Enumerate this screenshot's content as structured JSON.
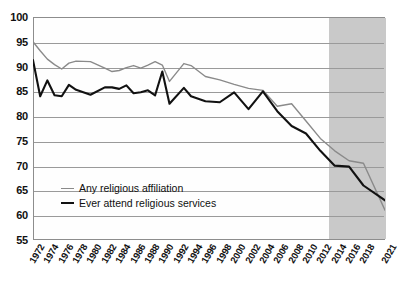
{
  "chart_data": {
    "type": "line",
    "title": "",
    "subtitle": "",
    "xlabel": "",
    "ylabel": "",
    "ylim": [
      55,
      100
    ],
    "ytick_step": 5,
    "yticks": [
      100,
      95,
      90,
      85,
      80,
      75,
      70,
      65,
      60,
      55
    ],
    "grid": true,
    "legend_position": "inside-lower-left",
    "xtick_labels": [
      "1972",
      "1974",
      "1976",
      "1978",
      "1980",
      "1982",
      "1984",
      "1986",
      "1988",
      "1990",
      "1992",
      "1994",
      "1996",
      "1998",
      "2000",
      "2002",
      "2004",
      "2006",
      "2008",
      "2010",
      "2012",
      "2014",
      "2016",
      "2018",
      "2021"
    ],
    "x": [
      1972,
      1973,
      1974,
      1975,
      1976,
      1977,
      1978,
      1980,
      1982,
      1983,
      1984,
      1985,
      1986,
      1987,
      1988,
      1989,
      1990,
      1991,
      1993,
      1994,
      1996,
      1998,
      2000,
      2002,
      2004,
      2006,
      2008,
      2010,
      2012,
      2014,
      2016,
      2018,
      2021
    ],
    "annotations": [
      {
        "type": "shaded-band",
        "label": "",
        "x_start": 2013,
        "x_end": 2021,
        "color": "#c9c9c9"
      }
    ],
    "series": [
      {
        "name": "Any religious affiliation",
        "color": "#8a8a8a",
        "values": [
          95.0,
          93.2,
          91.5,
          90.4,
          89.5,
          90.7,
          91.1,
          91.0,
          89.7,
          89.0,
          89.2,
          89.8,
          90.2,
          89.7,
          90.3,
          91.0,
          90.3,
          87.0,
          90.6,
          90.2,
          88.0,
          87.3,
          86.4,
          85.6,
          85.2,
          82.0,
          82.5,
          79.0,
          75.5,
          73.0,
          71.0,
          70.5,
          61.0
        ]
      },
      {
        "name": "Ever attend religious services",
        "color": "#111111",
        "values": [
          91.3,
          84.0,
          87.2,
          84.2,
          84.0,
          86.3,
          85.3,
          84.3,
          85.8,
          85.8,
          85.5,
          86.2,
          84.6,
          84.8,
          85.2,
          84.2,
          89.0,
          82.5,
          85.7,
          84.0,
          83.0,
          82.8,
          84.8,
          81.4,
          85.0,
          81.0,
          78.0,
          76.5,
          73.0,
          70.0,
          69.8,
          66.0,
          63.0
        ]
      }
    ]
  },
  "legend": {
    "items": [
      {
        "label": "Any religious affiliation"
      },
      {
        "label": "Ever attend religious services"
      }
    ]
  }
}
